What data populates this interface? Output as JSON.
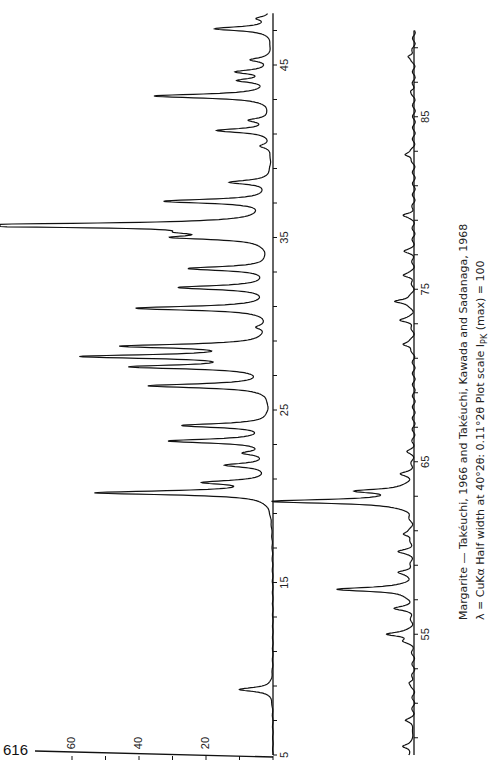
{
  "page_number": "616",
  "caption": {
    "line1": "Margarite — Takéuchi, 1966 and Takéuchi, Kawada and Sadanaga, 1968",
    "line2": "λ = CuKα   Half width at 40°2θ: 0.11°2θ   Plot scale I",
    "line2_sub": "PK",
    "line2_tail": " (max) = 100"
  },
  "chart_data": {
    "type": "line",
    "title": "Margarite — Takéuchi, 1966 and Takéuchi, Kawada and Sadanaga, 1968",
    "subtitle": "λ = CuKα  Half width at 40°2θ: 0.11°2θ  Plot scale I_PK (max) = 100",
    "xlabel": "2θ (degrees)",
    "ylabel": "Intensity I_PK",
    "orientation": "rotated 90° (2θ runs bottom-to-top, intensity increases leftward)",
    "xlim": [
      5,
      90
    ],
    "ylim": [
      0,
      70
    ],
    "x_ticks_labeled": [
      5,
      15,
      25,
      35,
      45,
      55,
      65,
      75,
      85
    ],
    "x_tick_step": 2,
    "y_ticks_labeled": [
      20,
      40,
      60
    ],
    "y_tick_step": 10,
    "grid": false,
    "legend": null,
    "panels": [
      {
        "name": "strip-1",
        "x_range": [
          5,
          48
        ]
      },
      {
        "name": "strip-2",
        "x_range": [
          48,
          90
        ]
      }
    ],
    "peaks": [
      {
        "two_theta": 8.8,
        "intensity": 10
      },
      {
        "two_theta": 20.2,
        "intensity": 52
      },
      {
        "two_theta": 20.8,
        "intensity": 18
      },
      {
        "two_theta": 21.8,
        "intensity": 13
      },
      {
        "two_theta": 22.5,
        "intensity": 7
      },
      {
        "two_theta": 23.2,
        "intensity": 30
      },
      {
        "two_theta": 24.1,
        "intensity": 26
      },
      {
        "two_theta": 26.4,
        "intensity": 36
      },
      {
        "two_theta": 27.5,
        "intensity": 39
      },
      {
        "two_theta": 28.1,
        "intensity": 53
      },
      {
        "two_theta": 28.7,
        "intensity": 42
      },
      {
        "two_theta": 29.8,
        "intensity": 3
      },
      {
        "two_theta": 30.9,
        "intensity": 40
      },
      {
        "two_theta": 32.1,
        "intensity": 27
      },
      {
        "two_theta": 33.2,
        "intensity": 24
      },
      {
        "two_theta": 35.0,
        "intensity": 24
      },
      {
        "two_theta": 35.3,
        "intensity": 14
      },
      {
        "two_theta": 35.7,
        "intensity": 100
      },
      {
        "two_theta": 37.1,
        "intensity": 31
      },
      {
        "two_theta": 38.2,
        "intensity": 12
      },
      {
        "two_theta": 40.3,
        "intensity": 3
      },
      {
        "two_theta": 41.2,
        "intensity": 16
      },
      {
        "two_theta": 41.8,
        "intensity": 6
      },
      {
        "two_theta": 43.2,
        "intensity": 35
      },
      {
        "two_theta": 44.1,
        "intensity": 9
      },
      {
        "two_theta": 44.6,
        "intensity": 10
      },
      {
        "two_theta": 45.3,
        "intensity": 6
      },
      {
        "two_theta": 47.1,
        "intensity": 17
      },
      {
        "two_theta": 47.7,
        "intensity": 4
      },
      {
        "two_theta": 48.5,
        "intensity": 3
      },
      {
        "two_theta": 50.0,
        "intensity": 2
      },
      {
        "two_theta": 52.2,
        "intensity": 1.5
      },
      {
        "two_theta": 54.6,
        "intensity": 2
      },
      {
        "two_theta": 55.0,
        "intensity": 8
      },
      {
        "two_theta": 56.5,
        "intensity": 5
      },
      {
        "two_theta": 57.6,
        "intensity": 23
      },
      {
        "two_theta": 58.6,
        "intensity": 4
      },
      {
        "two_theta": 59.8,
        "intensity": 4
      },
      {
        "two_theta": 60.8,
        "intensity": 3
      },
      {
        "two_theta": 62.7,
        "intensity": 42
      },
      {
        "two_theta": 63.3,
        "intensity": 16
      },
      {
        "two_theta": 64.3,
        "intensity": 3
      },
      {
        "two_theta": 65.6,
        "intensity": 1.5
      },
      {
        "two_theta": 71.8,
        "intensity": 3.5
      },
      {
        "two_theta": 73.2,
        "intensity": 4
      },
      {
        "two_theta": 74.3,
        "intensity": 6
      },
      {
        "two_theta": 75.8,
        "intensity": 3
      },
      {
        "two_theta": 77.2,
        "intensity": 2.5
      },
      {
        "two_theta": 79.3,
        "intensity": 3
      },
      {
        "two_theta": 82.8,
        "intensity": 3
      },
      {
        "two_theta": 86.5,
        "intensity": 1
      },
      {
        "two_theta": 88.5,
        "intensity": 2
      }
    ]
  }
}
